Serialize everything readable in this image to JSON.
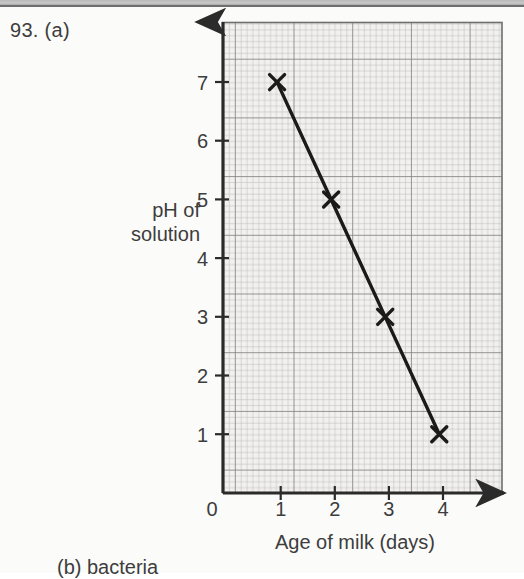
{
  "question": {
    "number_label": "93.  (a)",
    "part_b_label": "(b)   bacteria"
  },
  "chart_data": {
    "type": "line",
    "title": "",
    "xlabel": "Age of milk (days)",
    "ylabel": "pH of\nsolution",
    "ylabel_line1": "pH of",
    "ylabel_line2": "solution",
    "x": [
      1,
      2,
      3,
      4
    ],
    "values": [
      7,
      5,
      3,
      1
    ],
    "series": [
      {
        "name": "pH of solution",
        "values": [
          7,
          5,
          3,
          1
        ]
      }
    ],
    "xticks": [
      "1",
      "2",
      "3",
      "4"
    ],
    "yticks": [
      "1",
      "2",
      "3",
      "4",
      "5",
      "6",
      "7"
    ],
    "origin_label": "0",
    "xlim": [
      0,
      4.9
    ],
    "ylim": [
      0,
      8
    ],
    "grid": true,
    "grid_minor": true,
    "legend": "none",
    "marker": "x",
    "line_color": "#1a1a1a",
    "grid_color": "#8c8c8c",
    "grid_minor_color": "#b4b4b4",
    "axis_color": "#2b2b2b",
    "plot_background": "#f2f2f0"
  }
}
